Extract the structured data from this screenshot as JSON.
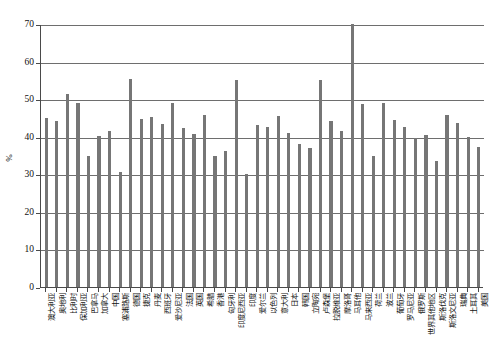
{
  "chart_data": {
    "type": "bar",
    "title": "",
    "subtitle": "",
    "xlabel": "",
    "ylabel": "%",
    "ylim": [
      0,
      70
    ],
    "ytick_values": [
      0,
      10,
      20,
      30,
      40,
      50,
      60,
      70
    ],
    "ytick_labels": [
      "0",
      "10",
      "20",
      "30",
      "40",
      "50",
      "60",
      "70"
    ],
    "grid": true,
    "legend": false,
    "bar_color": "#767676",
    "axis_color": "#4a4a4a",
    "grid_color": "#6e6e6e",
    "categories": [
      "澳大利亚",
      "奥地利",
      "比利时",
      "保加利亚",
      "巴拿马",
      "加拿大",
      "中国",
      "塞浦路斯",
      "德国",
      "捷克",
      "丹麦",
      "西班牙",
      "爱沙尼亚",
      "法国",
      "英国",
      "希腊",
      "香港",
      "匈牙利",
      "印度尼西亚",
      "印度",
      "爱尔兰",
      "以色列",
      "意大利",
      "日本",
      "韩国",
      "立陶宛",
      "卢森堡",
      "拉脱维亚",
      "摩洛哥",
      "马耳他",
      "马来西亚",
      "荷兰",
      "波兰",
      "葡萄牙",
      "罗马尼亚",
      "俄罗斯",
      "世界其他地区",
      "斯洛伐克",
      "斯洛文尼亚",
      "瑞典",
      "土耳其",
      "美国"
    ],
    "values": [
      45.0,
      44.2,
      51.3,
      49.1,
      34.9,
      40.2,
      41.5,
      30.7,
      55.3,
      44.8,
      45.3,
      43.3,
      49.1,
      42.4,
      40.8,
      45.7,
      34.8,
      36.3,
      55.1,
      30.0,
      43.0,
      42.5,
      45.5,
      41.0,
      38.0,
      36.9,
      55.2,
      44.3,
      41.5,
      69.9,
      48.8,
      35.0,
      49.0,
      44.5,
      42.5,
      39.7,
      40.5,
      33.5,
      45.8,
      43.7,
      40.0,
      37.3
    ]
  }
}
